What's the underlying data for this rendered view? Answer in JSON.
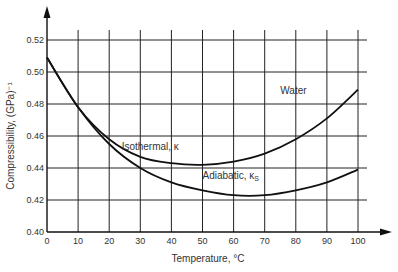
{
  "chart_data": {
    "type": "line",
    "title": "",
    "xlabel": "Temperature, °C",
    "ylabel": "Compressibility, (GPa)⁻¹",
    "xlim": [
      0,
      100
    ],
    "ylim": [
      0.4,
      0.52
    ],
    "grid": true,
    "x_ticks": [
      "0",
      "10",
      "20",
      "30",
      "40",
      "50",
      "60",
      "70",
      "80",
      "90",
      "100"
    ],
    "y_ticks": [
      "0.40",
      "0.42",
      "0.44",
      "0.46",
      "0.48",
      "0.50",
      "0.52"
    ],
    "x": [
      0,
      10,
      20,
      30,
      40,
      50,
      60,
      70,
      80,
      90,
      100
    ],
    "series": [
      {
        "name": "Isothermal, κ",
        "values": [
          0.509,
          0.478,
          0.458,
          0.447,
          0.443,
          0.442,
          0.444,
          0.449,
          0.458,
          0.471,
          0.489
        ]
      },
      {
        "name": "Adiabatic, κS",
        "values": [
          0.509,
          0.478,
          0.455,
          0.44,
          0.431,
          0.426,
          0.423,
          0.423,
          0.426,
          0.431,
          0.439
        ]
      }
    ],
    "annotations": [
      {
        "text": "Water",
        "x": 75,
        "y": 0.486
      },
      {
        "text": "Isothermal, κ",
        "x": 24,
        "y": 0.451
      },
      {
        "text": "Adiabatic, κS",
        "x": 50,
        "y": 0.433
      }
    ]
  }
}
